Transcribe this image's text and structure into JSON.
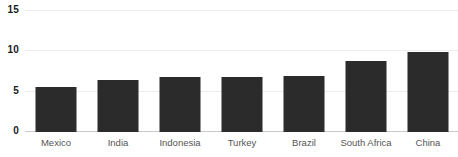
{
  "chart_data": {
    "type": "bar",
    "title": "",
    "subtitle": "",
    "xlabel": "",
    "ylabel": "",
    "categories": [
      "Mexico",
      "India",
      "Indonesia",
      "Turkey",
      "Brazil",
      "South Africa",
      "China"
    ],
    "values": [
      5.6,
      6.4,
      6.8,
      6.8,
      6.9,
      8.8,
      9.9
    ],
    "series": [
      {
        "name": "",
        "values": [
          5.6,
          6.4,
          6.8,
          6.8,
          6.9,
          8.8,
          9.9
        ]
      }
    ],
    "ylim": [
      0,
      15
    ],
    "yticks": [
      0,
      5,
      10,
      15
    ],
    "ytick_labels": [
      "0",
      "5",
      "10",
      "15"
    ],
    "grid": true,
    "grid_axis": "y",
    "legend": false,
    "legend_position": "none",
    "bar_color": "#2b2b2b",
    "grid_color": "#ededed",
    "axis_color": "#c9c9c9",
    "tick_label_color": "#1a1a1a",
    "category_label_color": "#555555",
    "background_color": "#ffffff"
  }
}
